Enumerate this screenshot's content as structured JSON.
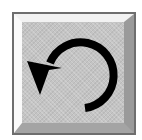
{
  "button": {
    "icon": "undo-icon",
    "label": "Undo",
    "colors": {
      "face": "#c4c4c4",
      "border": "#6e6e6e",
      "highlight": "#fafafa",
      "shadow": "#9a9a9a",
      "glyph": "#000000"
    }
  }
}
